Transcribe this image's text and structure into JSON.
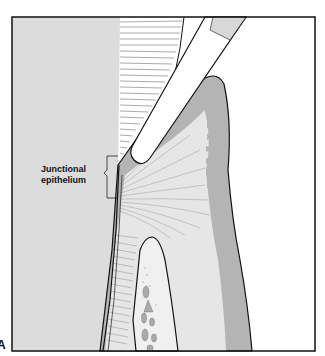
{
  "figure": {
    "panel_letter": "A",
    "labels": {
      "junctional_epithelium_line1": "Junctional",
      "junctional_epithelium_line2": "epithelium"
    },
    "colors": {
      "tooth": "#dcdcdc",
      "gingiva_outer": "#b4b4b4",
      "connective_tissue": "#e6e6e6",
      "bone": "#f0f0f0",
      "bone_marrow": "#aaaaaa",
      "instrument": "#ffffff",
      "instrument_tip": "#d8d8d8",
      "outline": "#111111",
      "background": "#ffffff"
    },
    "elements": [
      "tooth",
      "periodontal pocket fibers",
      "probe instrument",
      "gingiva",
      "junctional epithelium",
      "alveolar bone"
    ]
  }
}
